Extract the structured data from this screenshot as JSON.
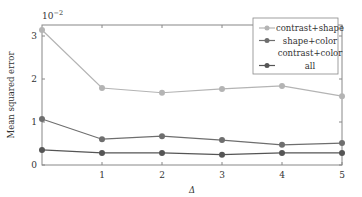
{
  "chart_data": {
    "type": "line",
    "title": "",
    "xlabel": "Δ",
    "ylabel": "Mean squared error",
    "y_scale_label": "10^-2",
    "x": [
      0,
      1,
      2,
      3,
      4,
      5
    ],
    "x_ticks": [
      "1",
      "2",
      "3",
      "4",
      "5"
    ],
    "y_ticks": [
      "0",
      "1",
      "2",
      "3"
    ],
    "xlim": [
      0,
      5
    ],
    "ylim": [
      0,
      3.25
    ],
    "grid": false,
    "legend_position": "upper right",
    "series": [
      {
        "name": "contrast+shape",
        "color": "#b4b4b4",
        "values": [
          3.14,
          1.79,
          1.68,
          1.77,
          1.84,
          1.6
        ]
      },
      {
        "name": "shape+color",
        "color": "#6e6e6e",
        "values": [
          1.07,
          0.6,
          0.67,
          0.58,
          0.47,
          0.51
        ]
      },
      {
        "name": "contrast+color",
        "color": "#ffffff",
        "values": [
          null,
          null,
          null,
          null,
          null,
          null
        ]
      },
      {
        "name": "all",
        "color": "#555555",
        "values": [
          0.35,
          0.28,
          0.28,
          0.24,
          0.28,
          0.28
        ]
      }
    ]
  }
}
